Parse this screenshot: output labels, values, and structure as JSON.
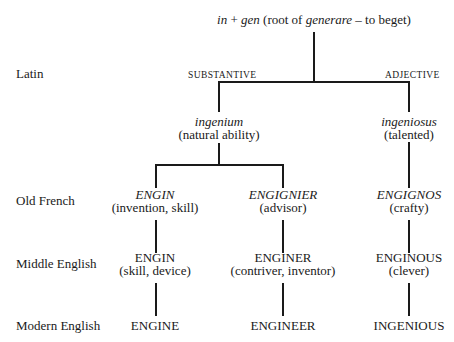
{
  "diagram": {
    "root": {
      "prefix": "in",
      "plus": " + ",
      "stem": "gen",
      "gloss_open": " (root of ",
      "gloss_word": "generare",
      "gloss_close": " – to beget)"
    },
    "row_labels": [
      "Latin",
      "Old French",
      "Middle English",
      "Modern English"
    ],
    "branch_labels": {
      "substantive": "SUBSTANTIVE",
      "adjective": "ADJECTIVE"
    },
    "latin": {
      "substantive": {
        "word": "ingenium",
        "gloss": "(natural ability)"
      },
      "adjective": {
        "word": "ingeniosus",
        "gloss": "(talented)"
      }
    },
    "old_french": [
      {
        "word": "ENGIN",
        "gloss": "(invention, skill)"
      },
      {
        "word": "ENGIGNIER",
        "gloss": "(advisor)"
      },
      {
        "word": "ENGIGNOS",
        "gloss": "(crafty)"
      }
    ],
    "middle_english": [
      {
        "word": "ENGIN",
        "gloss": "(skill, device)"
      },
      {
        "word": "ENGINER",
        "gloss": "(contriver, inventor)"
      },
      {
        "word": "ENGINOUS",
        "gloss": "(clever)"
      }
    ],
    "modern_english": [
      "ENGINE",
      "ENGINEER",
      "INGENIOUS"
    ]
  }
}
